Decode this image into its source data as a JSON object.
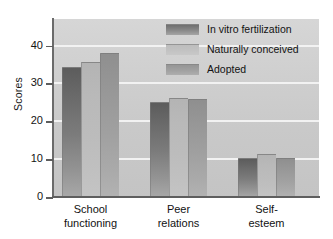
{
  "chart_data": {
    "type": "bar",
    "title": "",
    "xlabel": "",
    "ylabel": "Scores",
    "ylim": [
      0,
      47
    ],
    "yticks": [
      0,
      10,
      20,
      30,
      40
    ],
    "ytick_labels": [
      "0",
      "10",
      "20",
      "30",
      "40"
    ],
    "grid": true,
    "legend_position": "top-right",
    "categories": [
      "School functioning",
      "Peer relations",
      "Self-esteem"
    ],
    "category_lines": [
      [
        "School",
        "functioning"
      ],
      [
        "Peer",
        "relations"
      ],
      [
        "Self-",
        "esteem"
      ]
    ],
    "series": [
      {
        "name": "In vitro fertilization",
        "values": [
          34.3,
          25.2,
          10.3
        ],
        "color": "#7c7c7c"
      },
      {
        "name": "Naturally conceived",
        "values": [
          35.6,
          26.2,
          11.3
        ],
        "color": "#bcbcbc"
      },
      {
        "name": "Adopted",
        "values": [
          38.0,
          26.0,
          10.4
        ],
        "color": "#a0a0a0"
      }
    ]
  },
  "axis": {
    "y_title": "Scores"
  },
  "legend": {
    "entries": [
      "In vitro fertilization",
      "Naturally conceived",
      "Adopted"
    ]
  },
  "colors": {
    "plot_background": "#cfcfcf",
    "gridline": "#f2f2f2",
    "axis": "#5e5e5e",
    "page_background": "#ffffff"
  }
}
